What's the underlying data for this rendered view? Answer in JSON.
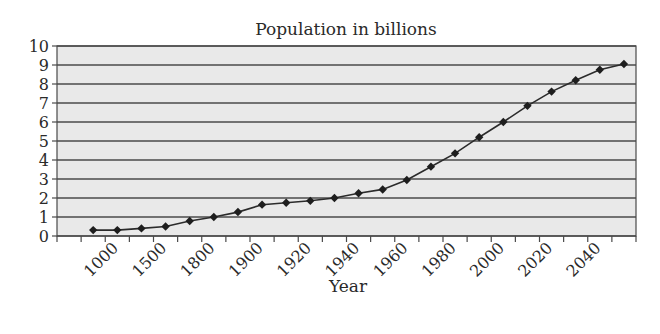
{
  "chart_data": {
    "type": "line",
    "title": "Population in billions",
    "xlabel": "Year",
    "ylabel": "",
    "ylim": [
      0,
      10
    ],
    "yticks": [
      0,
      1,
      2,
      3,
      4,
      5,
      6,
      7,
      8,
      9,
      10
    ],
    "grid": true,
    "legend": "none",
    "category_slots": 24,
    "first_point_slot": 1,
    "x_tick_labels": [
      {
        "point_index": 1,
        "label": "1000"
      },
      {
        "point_index": 3,
        "label": "1500"
      },
      {
        "point_index": 5,
        "label": "1800"
      },
      {
        "point_index": 7,
        "label": "1900"
      },
      {
        "point_index": 9,
        "label": "1920"
      },
      {
        "point_index": 11,
        "label": "1940"
      },
      {
        "point_index": 13,
        "label": "1960"
      },
      {
        "point_index": 15,
        "label": "1980"
      },
      {
        "point_index": 17,
        "label": "2000"
      },
      {
        "point_index": 19,
        "label": "2020"
      },
      {
        "point_index": 21,
        "label": "2040"
      }
    ],
    "series": [
      {
        "name": "Population",
        "color": "#1e1e1e",
        "marker": "diamond",
        "values": [
          0.31,
          0.31,
          0.4,
          0.5,
          0.79,
          1.0,
          1.26,
          1.65,
          1.75,
          1.85,
          2.0,
          2.25,
          2.45,
          2.95,
          3.65,
          4.35,
          5.2,
          6.0,
          6.85,
          7.6,
          8.2,
          8.75,
          9.05
        ]
      }
    ]
  }
}
